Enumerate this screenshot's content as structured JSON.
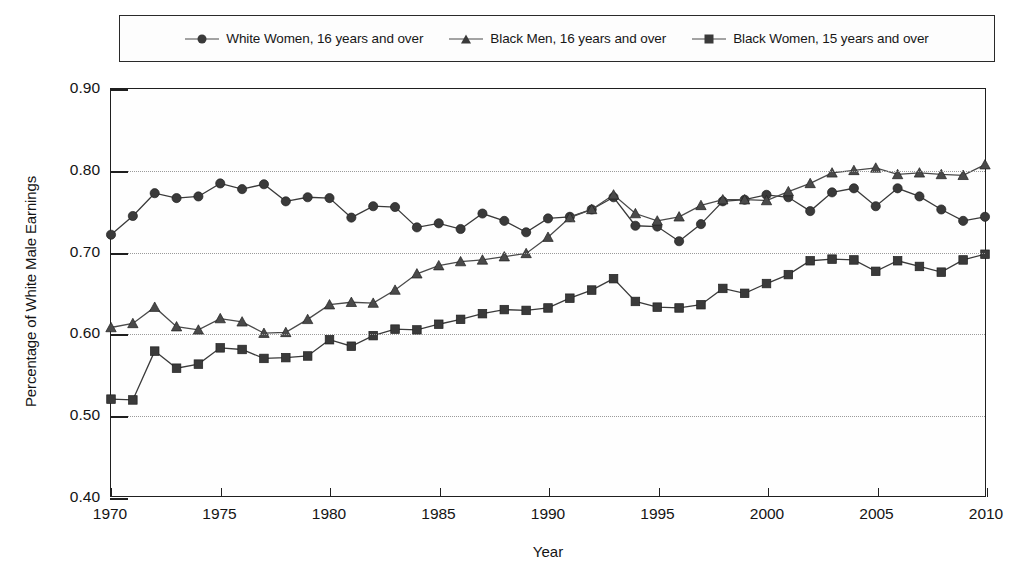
{
  "chart_data": {
    "type": "line",
    "title": "",
    "xlabel": "Year",
    "ylabel": "Percentage of White Male Earnings",
    "xlim": [
      1970,
      2010
    ],
    "ylim": [
      0.4,
      0.9
    ],
    "yticks": [
      "0.40",
      "0.50",
      "0.60",
      "0.70",
      "0.80",
      "0.90"
    ],
    "ytick_values": [
      0.4,
      0.5,
      0.6,
      0.7,
      0.8,
      0.9
    ],
    "xticks": [
      "1970",
      "1975",
      "1980",
      "1985",
      "1990",
      "1995",
      "2000",
      "2005",
      "2010"
    ],
    "xtick_values": [
      1970,
      1975,
      1980,
      1985,
      1990,
      1995,
      2000,
      2005,
      2010
    ],
    "grid": true,
    "legend_position": "top",
    "x": [
      1970,
      1971,
      1972,
      1973,
      1974,
      1975,
      1976,
      1977,
      1978,
      1979,
      1980,
      1981,
      1982,
      1983,
      1984,
      1985,
      1986,
      1987,
      1988,
      1989,
      1990,
      1991,
      1992,
      1993,
      1994,
      1995,
      1996,
      1997,
      1998,
      1999,
      2000,
      2001,
      2002,
      2003,
      2004,
      2005,
      2006,
      2007,
      2008,
      2009,
      2010
    ],
    "series": [
      {
        "name": "White Women, 16 years and over",
        "marker": "circle",
        "color": "#3a3a3a",
        "values": [
          0.721,
          0.744,
          0.772,
          0.766,
          0.768,
          0.784,
          0.777,
          0.783,
          0.762,
          0.767,
          0.766,
          0.742,
          0.756,
          0.755,
          0.73,
          0.735,
          0.728,
          0.747,
          0.738,
          0.724,
          0.741,
          0.743,
          0.752,
          0.767,
          0.732,
          0.731,
          0.713,
          0.734,
          0.762,
          0.764,
          0.77,
          0.767,
          0.75,
          0.773,
          0.778,
          0.756,
          0.778,
          0.768,
          0.752,
          0.738,
          0.743
        ]
      },
      {
        "name": "Black Men, 16 years and over",
        "marker": "triangle",
        "color": "#4a4a4a",
        "values": [
          0.607,
          0.612,
          0.632,
          0.608,
          0.604,
          0.618,
          0.614,
          0.6,
          0.601,
          0.617,
          0.635,
          0.638,
          0.637,
          0.653,
          0.673,
          0.683,
          0.688,
          0.69,
          0.694,
          0.698,
          0.718,
          0.742,
          0.752,
          0.77,
          0.747,
          0.738,
          0.743,
          0.757,
          0.764,
          0.764,
          0.763,
          0.774,
          0.784,
          0.797,
          0.8,
          0.803,
          0.795,
          0.797,
          0.795,
          0.794,
          0.807
        ]
      },
      {
        "name": "Black  Women, 15 years and over",
        "marker": "square",
        "color": "#3a3a3a",
        "values": [
          0.519,
          0.518,
          0.578,
          0.557,
          0.562,
          0.582,
          0.58,
          0.569,
          0.57,
          0.572,
          0.592,
          0.584,
          0.597,
          0.605,
          0.604,
          0.611,
          0.617,
          0.624,
          0.629,
          0.628,
          0.631,
          0.643,
          0.653,
          0.667,
          0.639,
          0.632,
          0.631,
          0.635,
          0.655,
          0.649,
          0.661,
          0.672,
          0.689,
          0.691,
          0.69,
          0.676,
          0.689,
          0.682,
          0.675,
          0.69,
          0.697
        ]
      }
    ]
  },
  "legend": {
    "entries": [
      {
        "label": "White Women, 16 years and over",
        "marker": "circle"
      },
      {
        "label": "Black Men, 16 years and over",
        "marker": "triangle"
      },
      {
        "label": "Black  Women, 15 years and over",
        "marker": "square"
      }
    ]
  },
  "axes": {
    "x_title": "Year",
    "y_title": "Percentage of White Male Earnings"
  }
}
